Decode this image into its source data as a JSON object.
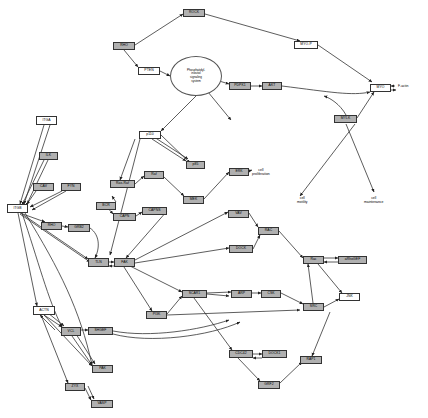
{
  "diagram": {
    "type": "biological-pathway",
    "width": 428,
    "height": 418,
    "node_fill_gray": "#b0b0b0",
    "node_fill_white": "#ffffff",
    "edge_color": "#333333",
    "background": "#ffffff"
  },
  "nodes": [
    {
      "id": "n0",
      "label": "ROCK",
      "style": "gray",
      "x": 183,
      "y": 9,
      "w": 22,
      "h": 8
    },
    {
      "id": "n1",
      "label": "RHO",
      "style": "gray",
      "x": 113,
      "y": 42,
      "w": 22,
      "h": 8
    },
    {
      "id": "n2",
      "label": "PTEN",
      "style": "white",
      "x": 138,
      "y": 67,
      "w": 22,
      "h": 8
    },
    {
      "id": "n3",
      "label": "MYO-P",
      "style": "white",
      "x": 294,
      "y": 41,
      "w": 24,
      "h": 8
    },
    {
      "id": "n4",
      "label": "PDPK1",
      "style": "gray",
      "x": 229,
      "y": 82,
      "w": 22,
      "h": 8
    },
    {
      "id": "n5",
      "label": "AKT",
      "style": "gray",
      "x": 262,
      "y": 82,
      "w": 20,
      "h": 8
    },
    {
      "id": "n6",
      "label": "MYO",
      "style": "white",
      "x": 370,
      "y": 84,
      "w": 21,
      "h": 8
    },
    {
      "id": "n7",
      "label": "MYLK",
      "style": "gray",
      "x": 334,
      "y": 115,
      "w": 23,
      "h": 8
    },
    {
      "id": "n8",
      "label": "ITGA",
      "style": "white",
      "x": 36,
      "y": 116,
      "w": 21,
      "h": 9
    },
    {
      "id": "n9",
      "label": "p110",
      "style": "white",
      "x": 139,
      "y": 131,
      "w": 22,
      "h": 8
    },
    {
      "id": "n10",
      "label": "ILK",
      "style": "gray",
      "x": 39,
      "y": 152,
      "w": 19,
      "h": 8
    },
    {
      "id": "n11",
      "label": "p85",
      "style": "gray",
      "x": 186,
      "y": 161,
      "w": 19,
      "h": 8
    },
    {
      "id": "n12",
      "label": "ERK",
      "style": "gray",
      "x": 229,
      "y": 168,
      "w": 20,
      "h": 8
    },
    {
      "id": "n13",
      "label": "CAV",
      "style": "gray",
      "x": 33,
      "y": 183,
      "w": 21,
      "h": 8
    },
    {
      "id": "n14",
      "label": "FYN",
      "style": "gray",
      "x": 61,
      "y": 183,
      "w": 20,
      "h": 8
    },
    {
      "id": "n15",
      "label": "Ras-Raf",
      "style": "gray",
      "x": 110,
      "y": 180,
      "w": 25,
      "h": 8
    },
    {
      "id": "n16",
      "label": "Raf",
      "style": "gray",
      "x": 144,
      "y": 171,
      "w": 20,
      "h": 8
    },
    {
      "id": "n17",
      "label": "MEK",
      "style": "gray",
      "x": 183,
      "y": 196,
      "w": 21,
      "h": 8
    },
    {
      "id": "n18",
      "label": "ITGB",
      "style": "white",
      "x": 7,
      "y": 204,
      "w": 21,
      "h": 9
    },
    {
      "id": "n19",
      "label": "BCR",
      "style": "gray",
      "x": 96,
      "y": 202,
      "w": 20,
      "h": 8
    },
    {
      "id": "n20",
      "label": "CAPN",
      "style": "gray",
      "x": 113,
      "y": 213,
      "w": 23,
      "h": 8
    },
    {
      "id": "n21",
      "label": "CAPNS",
      "style": "gray",
      "x": 142,
      "y": 207,
      "w": 25,
      "h": 8
    },
    {
      "id": "n22",
      "label": "RHO",
      "style": "gray",
      "x": 41,
      "y": 222,
      "w": 21,
      "h": 8
    },
    {
      "id": "n23",
      "label": "GRB2",
      "style": "gray",
      "x": 68,
      "y": 224,
      "w": 22,
      "h": 8
    },
    {
      "id": "n24",
      "label": "VAV",
      "style": "gray",
      "x": 228,
      "y": 210,
      "w": 21,
      "h": 8
    },
    {
      "id": "n25",
      "label": "RAC",
      "style": "gray",
      "x": 258,
      "y": 227,
      "w": 21,
      "h": 8
    },
    {
      "id": "n26",
      "label": "TLN",
      "style": "gray",
      "x": 88,
      "y": 258,
      "w": 21,
      "h": 9
    },
    {
      "id": "n27",
      "label": "FAK",
      "style": "gray",
      "x": 114,
      "y": 258,
      "w": 21,
      "h": 9
    },
    {
      "id": "n28",
      "label": "DOCK",
      "style": "gray",
      "x": 229,
      "y": 245,
      "w": 24,
      "h": 8
    },
    {
      "id": "n29",
      "label": "Rac",
      "style": "gray",
      "x": 303,
      "y": 256,
      "w": 21,
      "h": 8
    },
    {
      "id": "n30",
      "label": "aRhoGEF",
      "style": "gray",
      "x": 338,
      "y": 256,
      "w": 29,
      "h": 8
    },
    {
      "id": "n31",
      "label": "ACTN",
      "style": "white",
      "x": 33,
      "y": 306,
      "w": 22,
      "h": 9
    },
    {
      "id": "n32",
      "label": "PI3K",
      "style": "gray",
      "x": 146,
      "y": 311,
      "w": 21,
      "h": 8
    },
    {
      "id": "n33",
      "label": "SCAR1",
      "style": "gray",
      "x": 182,
      "y": 290,
      "w": 25,
      "h": 8
    },
    {
      "id": "n34",
      "label": "ARP",
      "style": "gray",
      "x": 231,
      "y": 290,
      "w": 21,
      "h": 8
    },
    {
      "id": "n35",
      "label": "CSK",
      "style": "gray",
      "x": 261,
      "y": 290,
      "w": 20,
      "h": 8
    },
    {
      "id": "n36",
      "label": "JNK",
      "style": "white",
      "x": 339,
      "y": 293,
      "w": 21,
      "h": 8
    },
    {
      "id": "n37",
      "label": "SRC",
      "style": "gray",
      "x": 303,
      "y": 303,
      "w": 21,
      "h": 8
    },
    {
      "id": "n38",
      "label": "VCL",
      "style": "gray",
      "x": 61,
      "y": 327,
      "w": 20,
      "h": 9
    },
    {
      "id": "n39",
      "label": "SHGEF",
      "style": "gray",
      "x": 88,
      "y": 327,
      "w": 25,
      "h": 8
    },
    {
      "id": "n40",
      "label": "CDC42",
      "style": "gray",
      "x": 229,
      "y": 350,
      "w": 24,
      "h": 8
    },
    {
      "id": "n41",
      "label": "DOCK1",
      "style": "gray",
      "x": 262,
      "y": 350,
      "w": 25,
      "h": 8
    },
    {
      "id": "n42",
      "label": "RAP1",
      "style": "gray",
      "x": 300,
      "y": 356,
      "w": 22,
      "h": 8
    },
    {
      "id": "n43",
      "label": "PAK",
      "style": "gray",
      "x": 92,
      "y": 365,
      "w": 21,
      "h": 8
    },
    {
      "id": "n44",
      "label": "ZYX",
      "style": "gray",
      "x": 65,
      "y": 383,
      "w": 20,
      "h": 8
    },
    {
      "id": "n45",
      "label": "GRF2",
      "style": "gray",
      "x": 258,
      "y": 381,
      "w": 22,
      "h": 8
    },
    {
      "id": "n46",
      "label": "VASP",
      "style": "gray",
      "x": 91,
      "y": 400,
      "w": 22,
      "h": 8
    }
  ],
  "ellipses": [
    {
      "id": "e0",
      "label": "Phosphatidyl-\ninositol\nsignaling\nsystem",
      "x": 170,
      "y": 56,
      "w": 52,
      "h": 40
    }
  ],
  "process_labels": [
    {
      "id": "p0",
      "text": "cell\nproliferation",
      "x": 252,
      "y": 168
    },
    {
      "id": "p1",
      "text": "cell\nmotility",
      "x": 297,
      "y": 196
    },
    {
      "id": "p2",
      "text": "cell\nmaintenance",
      "x": 364,
      "y": 196
    }
  ],
  "free_labels": [
    {
      "id": "f0",
      "text": "F-actin",
      "x": 398,
      "y": 84
    }
  ],
  "edges": [
    {
      "from": "n1",
      "to": "n0"
    },
    {
      "from": "n1",
      "to": "n2"
    },
    {
      "from": "n0",
      "to": "n3"
    },
    {
      "from": "n2",
      "to": "e0"
    },
    {
      "from": "n3",
      "to": "n6"
    },
    {
      "from": "n4",
      "to": "n5"
    },
    {
      "from": "e0",
      "to": "n4"
    },
    {
      "from": "e0",
      "to": "n9"
    },
    {
      "from": "n9",
      "to": "e0"
    },
    {
      "from": "n5",
      "to": "n7"
    },
    {
      "from": "n7",
      "to": "n6"
    },
    {
      "from": "n6",
      "to": "n6b"
    },
    {
      "from": "n8",
      "to": "n18"
    },
    {
      "from": "n10",
      "to": "n18"
    },
    {
      "from": "n13",
      "to": "n18"
    },
    {
      "from": "n14",
      "to": "n18"
    },
    {
      "from": "n18",
      "to": "n26"
    },
    {
      "from": "n18",
      "to": "n31"
    },
    {
      "from": "n18",
      "to": "n22"
    },
    {
      "from": "n9",
      "to": "n11"
    },
    {
      "from": "n11",
      "to": "n9"
    },
    {
      "from": "n15",
      "to": "n16"
    },
    {
      "from": "n16",
      "to": "n17"
    },
    {
      "from": "n17",
      "to": "n12"
    },
    {
      "from": "n12",
      "to": "p0"
    },
    {
      "from": "n19",
      "to": "n15"
    },
    {
      "from": "n20",
      "to": "n21"
    },
    {
      "from": "n22",
      "to": "n23"
    },
    {
      "from": "n26",
      "to": "n27"
    },
    {
      "from": "n27",
      "to": "n26"
    },
    {
      "from": "n27",
      "to": "n32"
    },
    {
      "from": "n32",
      "to": "n33"
    },
    {
      "from": "n33",
      "to": "n34"
    },
    {
      "from": "n34",
      "to": "n35"
    },
    {
      "from": "n24",
      "to": "n25"
    },
    {
      "from": "n28",
      "to": "n25"
    },
    {
      "from": "n25",
      "to": "n29"
    },
    {
      "from": "n29",
      "to": "n30"
    },
    {
      "from": "n30",
      "to": "n29"
    },
    {
      "from": "n29",
      "to": "n36"
    },
    {
      "from": "n37",
      "to": "n29"
    },
    {
      "from": "n31",
      "to": "n38"
    },
    {
      "from": "n38",
      "to": "n39"
    },
    {
      "from": "n38",
      "to": "n43"
    },
    {
      "from": "n43",
      "to": "n46"
    },
    {
      "from": "n31",
      "to": "n44"
    },
    {
      "from": "n40",
      "to": "n41"
    },
    {
      "from": "n41",
      "to": "n40"
    },
    {
      "from": "n40",
      "to": "n45"
    },
    {
      "from": "n45",
      "to": "n42"
    },
    {
      "from": "n7",
      "to": "p1"
    },
    {
      "from": "n7",
      "to": "p2"
    },
    {
      "from": "n27",
      "to": "n24"
    },
    {
      "from": "n9",
      "to": "n27"
    }
  ]
}
